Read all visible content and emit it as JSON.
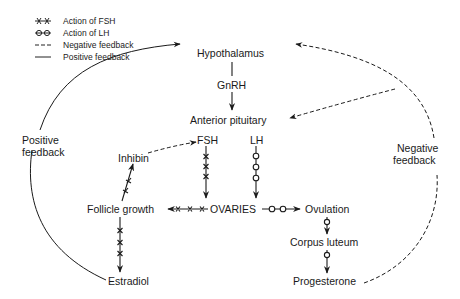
{
  "legend": {
    "items": [
      {
        "style": "line-with-x-marks",
        "label": "Action of FSH"
      },
      {
        "style": "line-with-o-marks",
        "label": "Action of LH"
      },
      {
        "style": "dashed-line",
        "label": "Negative feedback"
      },
      {
        "style": "solid-line",
        "label": "Positive feedback"
      }
    ]
  },
  "nodes": {
    "hypothalamus": "Hypothalamus",
    "gnrh": "GnRH",
    "anterior_pituitary": "Anterior pituitary",
    "fsh": "FSH",
    "lh": "LH",
    "inhibin": "Inhibin",
    "follicle_growth": "Follicle growth",
    "ovaries": "OVARIES",
    "ovulation": "Ovulation",
    "corpus_luteum": "Corpus luteum",
    "estradiol": "Estradiol",
    "progesterone": "Progesterone"
  },
  "loop_labels": {
    "positive": [
      "Positive",
      "feedback"
    ],
    "negative": [
      "Negative",
      "feedback"
    ]
  },
  "edges": [
    {
      "from": "Hypothalamus",
      "to": "Anterior pituitary",
      "type": "solid",
      "label": "GnRH"
    },
    {
      "from": "FSH",
      "to": "OVARIES",
      "type": "fsh"
    },
    {
      "from": "LH",
      "to": "OVARIES",
      "type": "lh"
    },
    {
      "from": "OVARIES",
      "to": "Follicle growth",
      "type": "fsh"
    },
    {
      "from": "Follicle growth",
      "to": "Inhibin",
      "type": "fsh"
    },
    {
      "from": "Follicle growth",
      "to": "Estradiol",
      "type": "fsh"
    },
    {
      "from": "OVARIES",
      "to": "Ovulation",
      "type": "lh"
    },
    {
      "from": "Ovulation",
      "to": "Corpus luteum",
      "type": "lh"
    },
    {
      "from": "Corpus luteum",
      "to": "Progesterone",
      "type": "lh"
    },
    {
      "from": "Inhibin",
      "to": "FSH",
      "type": "negative"
    },
    {
      "from": "Estradiol",
      "to": "Hypothalamus",
      "type": "positive"
    },
    {
      "from": "Progesterone",
      "to": "Hypothalamus",
      "type": "negative"
    },
    {
      "from": "Progesterone",
      "to": "Anterior pituitary",
      "type": "negative"
    }
  ],
  "colors": {
    "ink": "#1a1a1a",
    "background": "#ffffff"
  }
}
